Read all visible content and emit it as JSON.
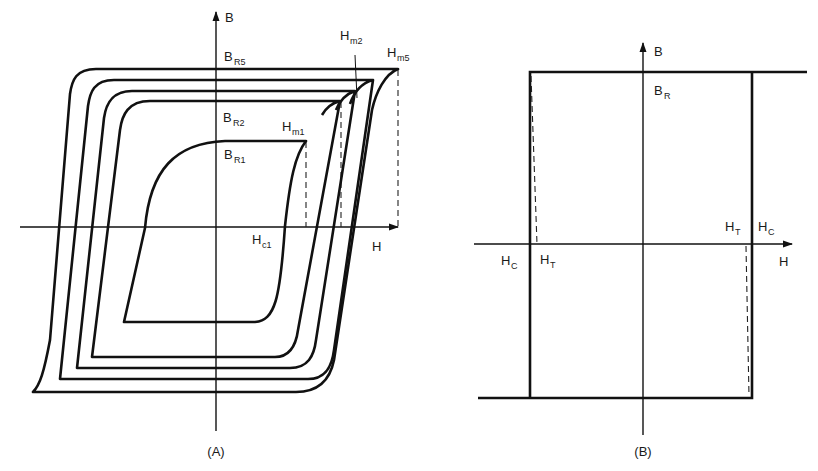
{
  "figure": {
    "panel_a": {
      "caption": "(A)",
      "axis_b_label": "B",
      "axis_h_label": "H",
      "labels": {
        "br5": {
          "main": "B",
          "sub": "R5"
        },
        "br2": {
          "main": "B",
          "sub": "R2"
        },
        "br1": {
          "main": "B",
          "sub": "R1"
        },
        "hm1": {
          "main": "H",
          "sub": "m1"
        },
        "hm2": {
          "main": "H",
          "sub": "m2"
        },
        "hm5": {
          "main": "H",
          "sub": "m5"
        },
        "hc1": {
          "main": "H",
          "sub": "c1"
        }
      },
      "loops": 5,
      "description": "Family of nested B-H hysteresis loops for increasing maximum field Hm1..Hm5"
    },
    "panel_b": {
      "caption": "(B)",
      "axis_b_label": "B",
      "axis_h_label": "H",
      "labels": {
        "br": {
          "main": "B",
          "sub": "R"
        },
        "hc_left": {
          "main": "H",
          "sub": "C"
        },
        "ht_left": {
          "main": "H",
          "sub": "T"
        },
        "ht_right": {
          "main": "H",
          "sub": "T"
        },
        "hc_right": {
          "main": "H",
          "sub": "C"
        }
      },
      "description": "Ideal square hysteresis loop with coercive field HC and threshold field HT"
    }
  }
}
